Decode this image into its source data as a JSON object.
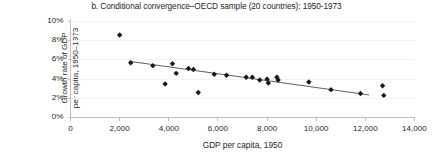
{
  "chart_data": {
    "type": "scatter",
    "title": "b. Conditional convergence–OECD sample (20 countries): 1950-1973",
    "xlabel": "GDP per capita, 1950",
    "ylabel_line1": "Growth rate of GDP",
    "ylabel_line2": "per capita, 1950–1973",
    "xlim": [
      0,
      14000
    ],
    "ylim": [
      0,
      10
    ],
    "xticks": [
      0,
      2000,
      4000,
      6000,
      8000,
      10000,
      12000,
      14000
    ],
    "xtick_labels": [
      "0",
      "2,000",
      "4,000",
      "6,000",
      "8,000",
      "10,000",
      "12,000",
      "14,000"
    ],
    "yticks": [
      0,
      2,
      4,
      6,
      8,
      10
    ],
    "ytick_labels": [
      "0%",
      "2%",
      "4%",
      "6%",
      "8%",
      "10%"
    ],
    "grid": true,
    "grid_axis": "y",
    "legend": false,
    "point_color": "#1a1a1a",
    "line_color": "#4d4d4d",
    "grid_color": "#f2f2f2",
    "axis_color": "#bfbfbf",
    "points": [
      {
        "x": 2000,
        "y": 8.6
      },
      {
        "x": 2450,
        "y": 5.7
      },
      {
        "x": 3350,
        "y": 5.4
      },
      {
        "x": 3850,
        "y": 3.5
      },
      {
        "x": 4150,
        "y": 5.6
      },
      {
        "x": 4300,
        "y": 4.6
      },
      {
        "x": 4800,
        "y": 5.1
      },
      {
        "x": 5000,
        "y": 5.0
      },
      {
        "x": 5200,
        "y": 2.6
      },
      {
        "x": 5850,
        "y": 4.5
      },
      {
        "x": 6350,
        "y": 4.4
      },
      {
        "x": 7150,
        "y": 4.2
      },
      {
        "x": 7400,
        "y": 4.2
      },
      {
        "x": 7700,
        "y": 3.9
      },
      {
        "x": 8000,
        "y": 4.0
      },
      {
        "x": 8050,
        "y": 3.6
      },
      {
        "x": 8400,
        "y": 4.2
      },
      {
        "x": 8450,
        "y": 3.9
      },
      {
        "x": 9700,
        "y": 3.7
      },
      {
        "x": 10600,
        "y": 2.9
      },
      {
        "x": 11800,
        "y": 2.5
      },
      {
        "x": 12700,
        "y": 3.3
      },
      {
        "x": 12750,
        "y": 2.3
      }
    ],
    "trendline": {
      "x_start": 2400,
      "y_start": 5.85,
      "x_end": 12150,
      "y_end": 2.35
    }
  }
}
